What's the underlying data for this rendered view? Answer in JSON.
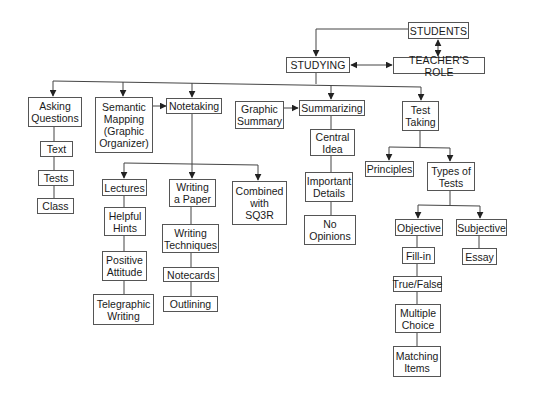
{
  "diagram": {
    "type": "concept-map",
    "nodes": {
      "students": "STUDENTS",
      "teachers_role": "TEACHER'S ROLE",
      "studying": "STUDYING",
      "asking_questions": "Asking\nQuestions",
      "text": "Text",
      "tests": "Tests",
      "class": "Class",
      "semantic_mapping": "Semantic\nMapping\n(Graphic\nOrganizer)",
      "notetaking": "Notetaking",
      "graphic_summary": "Graphic\nSummary",
      "summarizing": "Summarizing",
      "central_idea": "Central\nIdea",
      "important_details": "Important\nDetails",
      "no_opinions": "No\nOpinions",
      "test_taking": "Test\nTaking",
      "principles": "Principles",
      "types_of_tests": "Types of\nTests",
      "objective": "Objective",
      "subjective": "Subjective",
      "essay": "Essay",
      "fill_in": "Fill-in",
      "true_false": "True/False",
      "multiple_choice": "Multiple\nChoice",
      "matching_items": "Matching\nItems",
      "lectures": "Lectures",
      "helpful_hints": "Helpful\nHints",
      "positive_attitude": "Positive\nAttitude",
      "telegraphic_writing": "Telegraphic\nWriting",
      "writing_a_paper": "Writing\na Paper",
      "writing_techniques": "Writing\nTechniques",
      "notecards": "Notecards",
      "outlining": "Outlining",
      "combined_sq3r": "Combined\nwith\nSQ3R"
    },
    "edges": [
      {
        "from": "students",
        "to": "studying",
        "type": "arrow"
      },
      {
        "from": "students",
        "to": "teachers_role",
        "type": "double-arrow"
      },
      {
        "from": "studying",
        "to": "teachers_role",
        "type": "double-arrow"
      },
      {
        "from": "studying",
        "to": "asking_questions",
        "type": "arrow"
      },
      {
        "from": "studying",
        "to": "semantic_mapping",
        "type": "arrow"
      },
      {
        "from": "studying",
        "to": "notetaking",
        "type": "arrow"
      },
      {
        "from": "studying",
        "to": "summarizing",
        "type": "arrow"
      },
      {
        "from": "studying",
        "to": "test_taking",
        "type": "arrow"
      },
      {
        "from": "semantic_mapping",
        "to": "notetaking",
        "type": "arrow"
      },
      {
        "from": "graphic_summary",
        "to": "summarizing",
        "type": "arrow"
      },
      {
        "from": "asking_questions",
        "to": "text",
        "type": "line"
      },
      {
        "from": "text",
        "to": "tests",
        "type": "line"
      },
      {
        "from": "tests",
        "to": "class",
        "type": "line"
      },
      {
        "from": "notetaking",
        "to": "lectures",
        "type": "arrow"
      },
      {
        "from": "notetaking",
        "to": "writing_a_paper",
        "type": "arrow"
      },
      {
        "from": "notetaking",
        "to": "combined_sq3r",
        "type": "arrow"
      },
      {
        "from": "lectures",
        "to": "helpful_hints",
        "type": "line"
      },
      {
        "from": "helpful_hints",
        "to": "positive_attitude",
        "type": "line"
      },
      {
        "from": "positive_attitude",
        "to": "telegraphic_writing",
        "type": "line"
      },
      {
        "from": "writing_a_paper",
        "to": "writing_techniques",
        "type": "line"
      },
      {
        "from": "writing_techniques",
        "to": "notecards",
        "type": "line"
      },
      {
        "from": "notecards",
        "to": "outlining",
        "type": "line"
      },
      {
        "from": "summarizing",
        "to": "central_idea",
        "type": "line"
      },
      {
        "from": "central_idea",
        "to": "important_details",
        "type": "line"
      },
      {
        "from": "important_details",
        "to": "no_opinions",
        "type": "line"
      },
      {
        "from": "test_taking",
        "to": "principles",
        "type": "arrow"
      },
      {
        "from": "test_taking",
        "to": "types_of_tests",
        "type": "arrow"
      },
      {
        "from": "types_of_tests",
        "to": "objective",
        "type": "arrow"
      },
      {
        "from": "types_of_tests",
        "to": "subjective",
        "type": "arrow"
      },
      {
        "from": "objective",
        "to": "fill_in",
        "type": "line"
      },
      {
        "from": "fill_in",
        "to": "true_false",
        "type": "line"
      },
      {
        "from": "true_false",
        "to": "multiple_choice",
        "type": "line"
      },
      {
        "from": "multiple_choice",
        "to": "matching_items",
        "type": "line"
      },
      {
        "from": "subjective",
        "to": "essay",
        "type": "line"
      }
    ]
  }
}
